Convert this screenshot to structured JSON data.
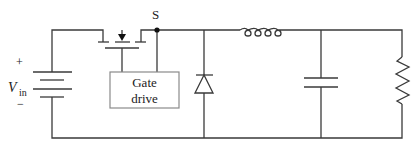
{
  "diagram": {
    "type": "circuit-schematic",
    "labels": {
      "switch_node": "S",
      "source_plus": "+",
      "source_minus": "−",
      "source_symbol": "V",
      "source_subscript": "in",
      "gate_drive_line1": "Gate",
      "gate_drive_line2": "drive"
    },
    "components": [
      {
        "id": "vin",
        "kind": "battery",
        "label": "V in"
      },
      {
        "id": "mosfet",
        "kind": "MOSFET switch"
      },
      {
        "id": "gate_drive",
        "kind": "block",
        "label": "Gate drive"
      },
      {
        "id": "diode",
        "kind": "diode"
      },
      {
        "id": "inductor",
        "kind": "inductor"
      },
      {
        "id": "capacitor",
        "kind": "capacitor"
      },
      {
        "id": "load",
        "kind": "resistor"
      }
    ],
    "colors": {
      "wire": "#3a3a3a",
      "box_border": "#8a8a8a",
      "background": "#ffffff"
    }
  }
}
